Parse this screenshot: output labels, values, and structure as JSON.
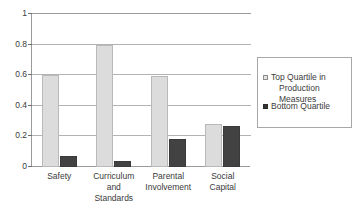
{
  "chart_data": {
    "type": "bar",
    "title": "",
    "subtitle": "",
    "xlabel": "",
    "ylabel": "",
    "categories": [
      "Safety",
      "Curriculum and Standards",
      "Parental Involvement",
      "Social Capital"
    ],
    "category_label_lines": [
      [
        "Safety"
      ],
      [
        "Curriculum",
        "and",
        "Standards"
      ],
      [
        "Parental",
        "Involvement"
      ],
      [
        "Social",
        "Capital"
      ]
    ],
    "series": [
      {
        "name": "Top Quartile in Production Measures",
        "color": "#dcdcdc",
        "values": [
          0.6,
          0.8,
          0.595,
          0.28
        ]
      },
      {
        "name": "Bottom Quartile",
        "color": "#424242",
        "values": [
          0.07,
          0.04,
          0.18,
          0.265
        ]
      }
    ],
    "ylim": [
      0,
      1
    ],
    "yticks": [
      0,
      0.2,
      0.4,
      0.6,
      0.8,
      1
    ],
    "ytick_labels": [
      "0",
      "0.2",
      "0.4",
      "0.6",
      "0.8",
      "1"
    ],
    "grid": true,
    "grid_axis": "y",
    "legend_position": "right",
    "legend_entries": [
      {
        "label": "Top Quartile in Production Measures",
        "label_lines": [
          "Top Quartile in",
          "Production Measures"
        ],
        "marker": "light-square"
      },
      {
        "label": "Bottom Quartile",
        "label_lines": [
          "Bottom Quartile"
        ],
        "marker": "dark-square"
      }
    ]
  },
  "colors": {
    "background": "#ffffff",
    "axis": "#9a9a9a",
    "gridline": "#b3b3b3",
    "text": "#3a3a3a",
    "series_top": "#dcdcdc",
    "series_bottom": "#424242",
    "legend_border": "#a8a8a8"
  }
}
